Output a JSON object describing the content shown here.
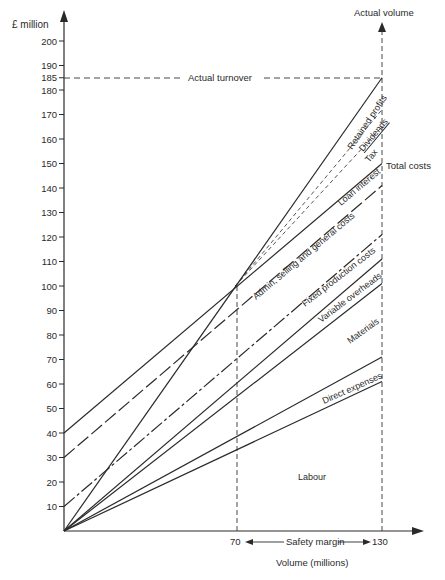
{
  "chart_data": {
    "type": "line",
    "title": "",
    "xlabel": "Volume (millions)",
    "ylabel": "£ million",
    "xlim": [
      0,
      140
    ],
    "ylim": [
      0,
      205
    ],
    "y_ticks": [
      10,
      20,
      30,
      40,
      50,
      60,
      70,
      80,
      90,
      100,
      110,
      120,
      130,
      140,
      150,
      160,
      170,
      180,
      185,
      190,
      200
    ],
    "x_ticks": [
      70,
      130
    ],
    "grid": false,
    "reference_lines": {
      "actual_turnover": {
        "label": "Actual turnover",
        "y": 185
      },
      "actual_volume": {
        "label": "Actual volume",
        "x": 130
      },
      "breakeven_volume": {
        "x": 70,
        "y": 100
      }
    },
    "safety_margin": {
      "label": "Safety margin",
      "from": 70,
      "to": 130
    },
    "series": [
      {
        "name": "Turnover (Retained profits upper bound)",
        "style": "solid",
        "points": [
          [
            0,
            0
          ],
          [
            130,
            185
          ]
        ]
      },
      {
        "name": "Dividends",
        "style": "dashed",
        "points": [
          [
            70,
            100
          ],
          [
            130,
            172
          ]
        ]
      },
      {
        "name": "Tax",
        "style": "dashed",
        "points": [
          [
            70,
            100
          ],
          [
            130,
            165
          ]
        ]
      },
      {
        "name": "Total costs",
        "style": "solid",
        "points": [
          [
            0,
            40
          ],
          [
            130,
            150
          ]
        ]
      },
      {
        "name": "Loan interest",
        "style": "long-dash",
        "points": [
          [
            0,
            30
          ],
          [
            130,
            141
          ]
        ]
      },
      {
        "name": "Admin, selling and general costs",
        "style": "dash-dot",
        "points": [
          [
            0,
            10
          ],
          [
            130,
            121
          ]
        ]
      },
      {
        "name": "Fixed production costs",
        "style": "solid",
        "points": [
          [
            0,
            0
          ],
          [
            130,
            111
          ]
        ]
      },
      {
        "name": "Variable overheads",
        "style": "solid",
        "points": [
          [
            0,
            0
          ],
          [
            130,
            101
          ]
        ]
      },
      {
        "name": "Direct expenses",
        "style": "solid",
        "points": [
          [
            0,
            0
          ],
          [
            130,
            71
          ]
        ]
      },
      {
        "name": "Labour",
        "style": "solid",
        "points": [
          [
            0,
            0
          ],
          [
            130,
            61
          ]
        ]
      }
    ],
    "band_labels": [
      "Retained profits",
      "Dividends",
      "Tax",
      "Loan interest",
      "Admin, selling and general costs",
      "Fixed production costs",
      "Variable overheads",
      "Materials",
      "Direct expenses",
      "Labour"
    ]
  },
  "labels": {
    "y_axis": "£ million",
    "x_axis": "Volume (millions)",
    "actual_volume": "Actual volume",
    "actual_turnover": "Actual turnover",
    "total_costs": "Total costs",
    "safety_margin": "Safety margin",
    "x70": "70",
    "x130": "130",
    "retained_profits": "Retained profits",
    "dividends": "Dividends",
    "tax": "Tax",
    "loan_interest": "Loan interest",
    "admin": "Admin, selling and general costs",
    "fixed": "Fixed production costs",
    "variable": "Variable overheads",
    "materials": "Materials",
    "direct": "Direct expenses",
    "labour": "Labour"
  }
}
